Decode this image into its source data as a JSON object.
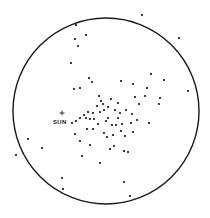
{
  "diagram": {
    "type": "star-distribution",
    "boundary": {
      "cx": 106,
      "cy": 111,
      "r": 93,
      "stroke": "#1a1a1a",
      "stroke_width": 1.4
    },
    "sun": {
      "label": "SUN",
      "marker": "+",
      "x": 62,
      "y": 113,
      "label_x": 53,
      "label_y": 124
    },
    "dot_color": "#111111",
    "points": [
      [
        76,
        25
      ],
      [
        86,
        35
      ],
      [
        75,
        39
      ],
      [
        78,
        46
      ],
      [
        71,
        63
      ],
      [
        89,
        78
      ],
      [
        92,
        82
      ],
      [
        74,
        89
      ],
      [
        80,
        88
      ],
      [
        99,
        96
      ],
      [
        101,
        101
      ],
      [
        142,
        15
      ],
      [
        179,
        38
      ],
      [
        151,
        74
      ],
      [
        164,
        80
      ],
      [
        121,
        81
      ],
      [
        133,
        84
      ],
      [
        147,
        88
      ],
      [
        188,
        91
      ],
      [
        160,
        98
      ],
      [
        135,
        97
      ],
      [
        145,
        96
      ],
      [
        139,
        104
      ],
      [
        159,
        104
      ],
      [
        72,
        123
      ],
      [
        76,
        121
      ],
      [
        80,
        118
      ],
      [
        86,
        118
      ],
      [
        90,
        119
      ],
      [
        94,
        119
      ],
      [
        84,
        115
      ],
      [
        88,
        112
      ],
      [
        93,
        113
      ],
      [
        100,
        112
      ],
      [
        104,
        110
      ],
      [
        87,
        129
      ],
      [
        93,
        129
      ],
      [
        104,
        133
      ],
      [
        75,
        134
      ],
      [
        80,
        141
      ],
      [
        28,
        139
      ],
      [
        42,
        148
      ],
      [
        16,
        155
      ],
      [
        90,
        145
      ],
      [
        82,
        156
      ],
      [
        100,
        163
      ],
      [
        62,
        178
      ],
      [
        63,
        189
      ],
      [
        108,
        118
      ],
      [
        112,
        125
      ],
      [
        116,
        125
      ],
      [
        122,
        124
      ],
      [
        131,
        123
      ],
      [
        137,
        120
      ],
      [
        149,
        123
      ],
      [
        121,
        131
      ],
      [
        125,
        136
      ],
      [
        133,
        132
      ],
      [
        113,
        135
      ],
      [
        107,
        137
      ],
      [
        114,
        146
      ],
      [
        124,
        151
      ],
      [
        128,
        152
      ],
      [
        110,
        149
      ],
      [
        124,
        182
      ],
      [
        130,
        196
      ],
      [
        97,
        106
      ],
      [
        103,
        104
      ],
      [
        108,
        107
      ],
      [
        115,
        110
      ],
      [
        120,
        113
      ],
      [
        126,
        110
      ],
      [
        132,
        114
      ],
      [
        118,
        103
      ],
      [
        111,
        99
      ],
      [
        106,
        121
      ],
      [
        98,
        124
      ],
      [
        118,
        118
      ]
    ]
  }
}
